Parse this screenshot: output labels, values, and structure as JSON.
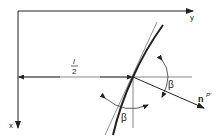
{
  "diagram": {
    "axes": {
      "y_label": "y",
      "x_label": "x"
    },
    "dimension": {
      "numerator": "l",
      "denominator": "2"
    },
    "angles": {
      "upper_label": "β",
      "lower_label": "β"
    },
    "normal_vector": {
      "base": "n",
      "superscript": "P'"
    },
    "colors": {
      "line": "#222222",
      "thin_line": "#555555",
      "background": "#ffffff"
    }
  }
}
